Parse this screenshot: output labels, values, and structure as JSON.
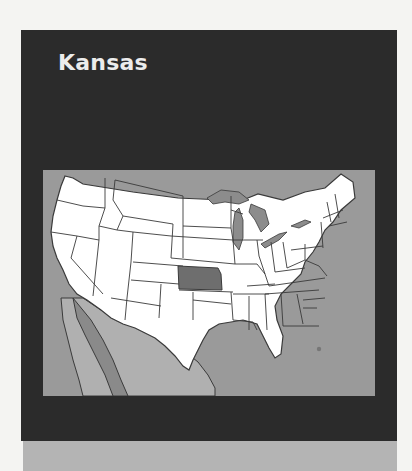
{
  "card": {
    "title": "Kansas"
  },
  "map": {
    "subject": "United States map",
    "highlighted_state": "Kansas",
    "colors": {
      "background_panel": "#2b2b2b",
      "water": "#9a9a9a",
      "mexico": "#b0b0b0",
      "baja_gulf": "#8a8a8a",
      "states": "#ffffff",
      "state_borders": "#3a3a3a",
      "highlight": "#6e6e6e",
      "great_lakes": "#8c8c8c"
    },
    "marker": {
      "location": "south Florida",
      "color": "#777777"
    }
  },
  "bottom_band": {
    "color": "#b4b4b4"
  }
}
